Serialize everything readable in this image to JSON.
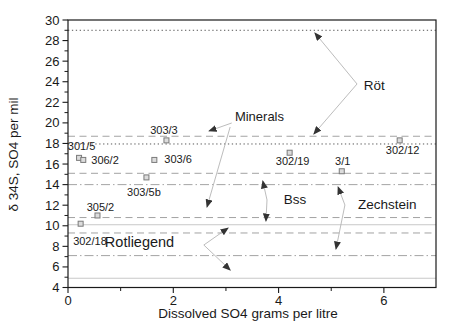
{
  "figure": {
    "width": 452,
    "height": 335,
    "background": "#ffffff"
  },
  "chart_data": {
    "type": "scatter",
    "title": "",
    "xlabel": "Dissolved SO4  grams per litre",
    "ylabel": "δ 34S, SO4 per mil",
    "xlim": [
      0,
      6.99
    ],
    "ylim": [
      4,
      30
    ],
    "grid": "none",
    "legend": "none",
    "x_ticks": {
      "major": [
        0,
        2,
        4,
        6
      ],
      "labels": [
        "0",
        "2",
        "4",
        "6"
      ],
      "minor": [
        1,
        3,
        5
      ]
    },
    "y_ticks": {
      "major": [
        4,
        6,
        8,
        10,
        12,
        14,
        16,
        18,
        20,
        22,
        24,
        26,
        28,
        30
      ],
      "labels": [
        "4",
        "6",
        "8",
        "10",
        "12",
        "14",
        "16",
        "18",
        "20",
        "22",
        "24",
        "26",
        "28",
        "30"
      ],
      "minor": [
        5,
        7,
        9,
        11,
        13,
        15,
        17,
        19,
        21,
        23,
        25,
        27,
        29
      ]
    },
    "marker": {
      "shape": "square",
      "size": 5,
      "fill": "#dcdcdc",
      "stroke": "#7a7a7a"
    },
    "points": [
      {
        "label": "301/5",
        "x": 0.21,
        "y": 16.6,
        "anchor": "middle",
        "lx": 2.5,
        "ly": -7.5
      },
      {
        "label": "306/2",
        "x": 0.29,
        "y": 16.4,
        "anchor": "start",
        "lx": 8,
        "ly": 4.5
      },
      {
        "label": "302/18",
        "x": 0.24,
        "y": 10.2,
        "anchor": "start",
        "lx": -7.5,
        "ly": 21.5
      },
      {
        "label": "305/2",
        "x": 0.56,
        "y": 11.0,
        "anchor": "middle",
        "lx": 3,
        "ly": -4.5
      },
      {
        "label": "303/5b",
        "x": 1.49,
        "y": 14.7,
        "anchor": "middle",
        "lx": -2.5,
        "ly": 19
      },
      {
        "label": "303/6",
        "x": 1.64,
        "y": 16.4,
        "anchor": "start",
        "lx": 10,
        "ly": 3.5
      },
      {
        "label": "303/3",
        "x": 1.87,
        "y": 18.3,
        "anchor": "middle",
        "lx": -2.5,
        "ly": -6.5
      },
      {
        "label": "302/19",
        "x": 4.21,
        "y": 17.1,
        "anchor": "middle",
        "lx": 3,
        "ly": 12.5
      },
      {
        "label": "3/1",
        "x": 5.2,
        "y": 15.3,
        "anchor": "middle",
        "lx": 1,
        "ly": -6.5
      },
      {
        "label": "302/12",
        "x": 6.3,
        "y": 18.3,
        "anchor": "middle",
        "lx": 3,
        "ly": 14
      }
    ],
    "ref_lines": [
      {
        "y": 29.0,
        "style": "dotted"
      },
      {
        "y": 18.7,
        "style": "dashed"
      },
      {
        "y": 17.95,
        "style": "dotted"
      },
      {
        "y": 15.1,
        "style": "dashed"
      },
      {
        "y": 14.0,
        "style": "dashdot"
      },
      {
        "y": 10.8,
        "style": "dashed"
      },
      {
        "y": 10.1,
        "style": "solid_light"
      },
      {
        "y": 9.3,
        "style": "dashed"
      },
      {
        "y": 7.1,
        "style": "dashdot"
      },
      {
        "y": 4.9,
        "style": "solid_light"
      }
    ],
    "annotations": [
      {
        "text": "Minerals",
        "x": 3.17,
        "y": 20.19,
        "font_size": 13,
        "arrows": [
          {
            "from": [
              3.11,
              19.99
            ],
            "to": [
              2.68,
              19.21
            ]
          },
          {
            "from": [
              3.08,
              19.6
            ],
            "to": [
              2.64,
              11.83
            ]
          }
        ]
      },
      {
        "text": "Röt",
        "x": 5.62,
        "y": 23.2,
        "font_size": 13.5,
        "arrows": [
          {
            "from": [
              5.49,
              23.78
            ],
            "to": [
              4.69,
              28.74
            ]
          },
          {
            "from": [
              5.49,
              23.78
            ],
            "to": [
              4.67,
              18.92
            ]
          }
        ]
      },
      {
        "text": "Bss",
        "x": 4.1,
        "y": 12.12,
        "font_size": 13.5,
        "arrows": [
          {
            "from": [
              3.78,
              12.51
            ],
            "to": [
              3.7,
              14.35
            ]
          },
          {
            "from": [
              3.78,
              12.51
            ],
            "to": [
              3.76,
              10.46
            ]
          }
        ]
      },
      {
        "text": "Zechstein",
        "x": 5.51,
        "y": 11.63,
        "font_size": 13.5,
        "arrows": [
          {
            "from": [
              5.26,
              12.02
            ],
            "to": [
              5.13,
              13.77
            ]
          },
          {
            "from": [
              5.26,
              12.02
            ],
            "to": [
              5.09,
              7.74
            ]
          }
        ]
      },
      {
        "text": "Rotliegend",
        "x": 0.7,
        "y": 7.94,
        "font_size": 14.5,
        "arrows": [
          {
            "from": [
              2.58,
              8.13
            ],
            "to": [
              3.04,
              9.78
            ]
          },
          {
            "from": [
              2.58,
              8.13
            ],
            "to": [
              3.08,
              5.7
            ]
          }
        ]
      }
    ],
    "colors": {
      "axis": "#1a1a1a",
      "text": "#1a1a1a",
      "dashed": "#999999",
      "dotted": "#444444",
      "dashdot": "#999999",
      "solid_light": "#c8c8c8",
      "arrow_line": "#b4b4b4",
      "arrow_head": "#333333"
    }
  }
}
